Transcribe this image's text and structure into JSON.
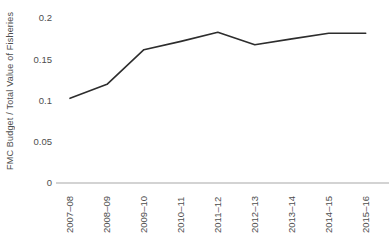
{
  "chart_data": {
    "type": "line",
    "title": "",
    "xlabel": "",
    "ylabel": "FMC Budget / Total Value of Fisheries",
    "categories": [
      "2007–08",
      "2008–09",
      "2009–10",
      "2010–11",
      "2011–12",
      "2012–13",
      "2013–14",
      "2014–15",
      "2015–16"
    ],
    "values": [
      0.103,
      0.12,
      0.162,
      0.172,
      0.183,
      0.168,
      0.175,
      0.182,
      0.182
    ],
    "series_name": "FMC Budget / Total Value of Fisheries",
    "ylim": [
      0,
      0.2
    ],
    "yticks": [
      0,
      0.05,
      0.1,
      0.15,
      0.2
    ],
    "ytick_labels": [
      "0",
      "0.05",
      "0.1",
      "0.15",
      "0.2"
    ],
    "grid": false,
    "legend": false,
    "colors": {
      "line": "#2d2d2d",
      "axis": "#a8a8a8",
      "text": "#4d4d4d",
      "background": "#ffffff"
    }
  }
}
